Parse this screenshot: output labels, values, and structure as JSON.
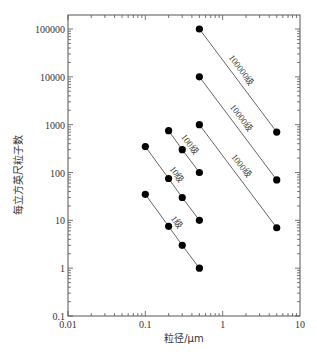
{
  "chart_data": {
    "type": "line",
    "title": "",
    "xlabel": "粒径/μm",
    "ylabel": "每立方英尺粒子数",
    "xscale": "log",
    "yscale": "log",
    "xlim": [
      0.01,
      10
    ],
    "ylim": [
      0.1,
      200000
    ],
    "x_ticks": [
      "0.01",
      "0.1",
      "1",
      "10"
    ],
    "y_ticks": [
      "0.1",
      "1",
      "10",
      "100",
      "1000",
      "10000",
      "100000"
    ],
    "grid": false,
    "legend": "none (inline labels along lines)",
    "series": [
      {
        "name": "1级",
        "points": [
          [
            0.1,
            35
          ],
          [
            0.2,
            7.5
          ],
          [
            0.3,
            3
          ],
          [
            0.5,
            1
          ]
        ]
      },
      {
        "name": "10级",
        "points": [
          [
            0.1,
            350
          ],
          [
            0.2,
            75
          ],
          [
            0.3,
            30
          ],
          [
            0.5,
            10
          ]
        ]
      },
      {
        "name": "100级",
        "points": [
          [
            0.2,
            750
          ],
          [
            0.3,
            300
          ],
          [
            0.5,
            100
          ]
        ]
      },
      {
        "name": "1000级",
        "points": [
          [
            0.5,
            1000
          ],
          [
            5,
            7
          ]
        ]
      },
      {
        "name": "10000级",
        "points": [
          [
            0.5,
            10000
          ],
          [
            5,
            70
          ]
        ]
      },
      {
        "name": "100000级",
        "points": [
          [
            0.5,
            100000
          ],
          [
            5,
            700
          ]
        ]
      }
    ]
  },
  "colors": {
    "line": "#555555",
    "marker": "#000000",
    "axis": "#555555",
    "text": "#333333"
  }
}
